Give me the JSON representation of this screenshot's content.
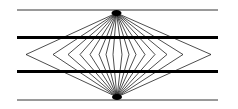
{
  "figure": {
    "width": 238,
    "height": 109,
    "colors": {
      "background": "#ffffff",
      "ink": "#000000"
    },
    "horizontal_lines": [
      {
        "name": "top-thin-line",
        "y": 10,
        "x1": 17,
        "x2": 218,
        "width": 0.8
      },
      {
        "name": "upper-thick-line",
        "y": 37.5,
        "x1": 17,
        "x2": 218,
        "width": 3.2
      },
      {
        "name": "lower-thick-line",
        "y": 71.5,
        "x1": 17,
        "x2": 218,
        "width": 3.2
      },
      {
        "name": "bottom-thin-line",
        "y": 100,
        "x1": 17,
        "x2": 218,
        "width": 0.8
      }
    ],
    "focal_points": [
      {
        "name": "top-focal-point",
        "x": 116.5,
        "y": 13
      },
      {
        "name": "bottom-focal-point",
        "x": 117,
        "y": 97
      }
    ],
    "apex_y": 54.5,
    "apex_x_left": [
      26,
      53,
      68,
      80,
      90,
      99,
      106,
      113
    ],
    "apex_x_right": [
      211,
      183,
      167,
      155,
      145,
      136,
      129,
      122
    ]
  }
}
